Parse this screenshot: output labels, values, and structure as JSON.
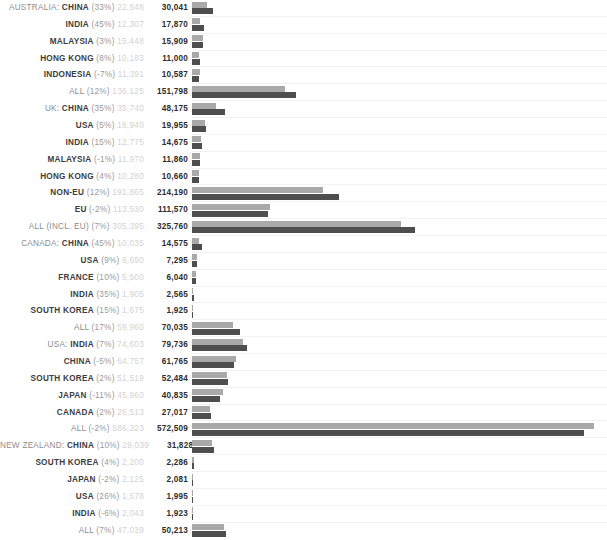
{
  "chart_data": {
    "type": "bar",
    "title": "",
    "subtitle": "",
    "xlabel": "",
    "ylabel": "",
    "grid": true,
    "legend": null,
    "orientation": "horizontal",
    "series": [
      {
        "name": "previous",
        "color": "#a9a9a9"
      },
      {
        "name": "current",
        "color": "#4e4e4e"
      }
    ],
    "value_axis_max": 600000,
    "colors": {
      "bar_previous": "#a9a9a9",
      "bar_current": "#4e4e4e",
      "label_group": "#8d8d8d",
      "label_entity": "#3d3d3d",
      "label_percent": "#9a9a9a",
      "label_previous": "#d2d2d2",
      "label_current": "#2e2e2e",
      "gridline": "#f2f2f2",
      "background": "#ffffff"
    },
    "rows": [
      {
        "group": "AUSTRALIA:",
        "entity": "CHINA",
        "pct": "(33%)",
        "prev_label": "22,548",
        "curr_label": "30,041",
        "prev": 22548,
        "curr": 30041
      },
      {
        "group": "",
        "entity": "INDIA",
        "pct": "(45%)",
        "prev_label": "12,307",
        "curr_label": "17,870",
        "prev": 12307,
        "curr": 17870
      },
      {
        "group": "",
        "entity": "MALAYSIA",
        "pct": "(3%)",
        "prev_label": "15,448",
        "curr_label": "15,909",
        "prev": 15448,
        "curr": 15909
      },
      {
        "group": "",
        "entity": "HONG KONG",
        "pct": "(8%)",
        "prev_label": "10,183",
        "curr_label": "11,000",
        "prev": 10183,
        "curr": 11000
      },
      {
        "group": "",
        "entity": "INDONESIA",
        "pct": "(-7%)",
        "prev_label": "11,391",
        "curr_label": "10,587",
        "prev": 11391,
        "curr": 10587
      },
      {
        "group": "",
        "entity": "ALL",
        "pct": "(12%)",
        "prev_label": "136,125",
        "curr_label": "151,798",
        "prev": 136125,
        "curr": 151798,
        "entity_muted": true
      },
      {
        "group": "UK:",
        "entity": "CHINA",
        "pct": "(35%)",
        "prev_label": "35,740",
        "curr_label": "48,175",
        "prev": 35740,
        "curr": 48175
      },
      {
        "group": "",
        "entity": "USA",
        "pct": "(5%)",
        "prev_label": "18,940",
        "curr_label": "19,955",
        "prev": 18940,
        "curr": 19955
      },
      {
        "group": "",
        "entity": "INDIA",
        "pct": "(15%)",
        "prev_label": "12,775",
        "curr_label": "14,675",
        "prev": 12775,
        "curr": 14675
      },
      {
        "group": "",
        "entity": "MALAYSIA",
        "pct": "(-1%)",
        "prev_label": "11,970",
        "curr_label": "11,860",
        "prev": 11970,
        "curr": 11860
      },
      {
        "group": "",
        "entity": "HONG KONG",
        "pct": "(4%)",
        "prev_label": "10,280",
        "curr_label": "10,660",
        "prev": 10280,
        "curr": 10660
      },
      {
        "group": "",
        "entity": "NON-EU",
        "pct": "(12%)",
        "prev_label": "191,865",
        "curr_label": "214,190",
        "prev": 191865,
        "curr": 214190
      },
      {
        "group": "",
        "entity": "EU",
        "pct": "(-2%)",
        "prev_label": "113,530",
        "curr_label": "111,570",
        "prev": 113530,
        "curr": 111570
      },
      {
        "group": "",
        "entity": "ALL (INCL. EU)",
        "pct": "(7%)",
        "prev_label": "305,395",
        "curr_label": "325,760",
        "prev": 305395,
        "curr": 325760,
        "entity_muted": true
      },
      {
        "group": "CANADA:",
        "entity": "CHINA",
        "pct": "(45%)",
        "prev_label": "10,035",
        "curr_label": "14,575",
        "prev": 10035,
        "curr": 14575
      },
      {
        "group": "",
        "entity": "USA",
        "pct": "(9%)",
        "prev_label": "6,690",
        "curr_label": "7,295",
        "prev": 6690,
        "curr": 7295
      },
      {
        "group": "",
        "entity": "FRANCE",
        "pct": "(10%)",
        "prev_label": "5,500",
        "curr_label": "6,040",
        "prev": 5500,
        "curr": 6040
      },
      {
        "group": "",
        "entity": "INDIA",
        "pct": "(35%)",
        "prev_label": "1,905",
        "curr_label": "2,565",
        "prev": 1905,
        "curr": 2565
      },
      {
        "group": "",
        "entity": "SOUTH KOREA",
        "pct": "(15%)",
        "prev_label": "1,675",
        "curr_label": "1,925",
        "prev": 1675,
        "curr": 1925
      },
      {
        "group": "",
        "entity": "ALL",
        "pct": "(17%)",
        "prev_label": "59,960",
        "curr_label": "70,035",
        "prev": 59960,
        "curr": 70035,
        "entity_muted": true
      },
      {
        "group": "USA:",
        "entity": "INDIA",
        "pct": "(7%)",
        "prev_label": "74,603",
        "curr_label": "79,736",
        "prev": 74603,
        "curr": 79736
      },
      {
        "group": "",
        "entity": "CHINA",
        "pct": "(-5%)",
        "prev_label": "64,757",
        "curr_label": "61,765",
        "prev": 64757,
        "curr": 61765
      },
      {
        "group": "",
        "entity": "SOUTH KOREA",
        "pct": "(2%)",
        "prev_label": "51,519",
        "curr_label": "52,484",
        "prev": 51519,
        "curr": 52484
      },
      {
        "group": "",
        "entity": "JAPAN",
        "pct": "(-11%)",
        "prev_label": "45,960",
        "curr_label": "40,835",
        "prev": 45960,
        "curr": 40835
      },
      {
        "group": "",
        "entity": "CANADA",
        "pct": "(2%)",
        "prev_label": "26,513",
        "curr_label": "27,017",
        "prev": 26513,
        "curr": 27017
      },
      {
        "group": "",
        "entity": "ALL",
        "pct": "(-2%)",
        "prev_label": "586,323",
        "curr_label": "572,509",
        "prev": 586323,
        "curr": 572509,
        "entity_muted": true
      },
      {
        "group": "NEW ZEALAND:",
        "entity": "CHINA",
        "pct": "(10%)",
        "prev_label": "29,039",
        "curr_label": "31,828",
        "prev": 29039,
        "curr": 31828
      },
      {
        "group": "",
        "entity": "SOUTH KOREA",
        "pct": "(4%)",
        "prev_label": "2,200",
        "curr_label": "2,286",
        "prev": 2200,
        "curr": 2286
      },
      {
        "group": "",
        "entity": "JAPAN",
        "pct": "(-2%)",
        "prev_label": "2,125",
        "curr_label": "2,081",
        "prev": 2125,
        "curr": 2081
      },
      {
        "group": "",
        "entity": "USA",
        "pct": "(26%)",
        "prev_label": "1,578",
        "curr_label": "1,995",
        "prev": 1578,
        "curr": 1995
      },
      {
        "group": "",
        "entity": "INDIA",
        "pct": "(-6%)",
        "prev_label": "2,043",
        "curr_label": "1,923",
        "prev": 2043,
        "curr": 1923
      },
      {
        "group": "",
        "entity": "ALL",
        "pct": "(7%)",
        "prev_label": "47,039",
        "curr_label": "50,213",
        "prev": 47039,
        "curr": 50213,
        "entity_muted": true
      }
    ]
  }
}
